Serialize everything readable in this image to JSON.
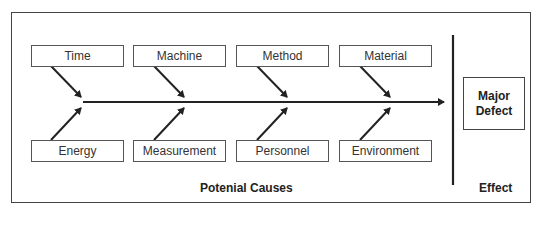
{
  "diagram": {
    "type": "fishbone",
    "top_causes": [
      "Time",
      "Machine",
      "Method",
      "Material"
    ],
    "bottom_causes": [
      "Energy",
      "Measurement",
      "Personnel",
      "Environment"
    ],
    "effect": {
      "line1": "Major",
      "line2": "Defect"
    },
    "causes_label": "Potenial Causes",
    "effect_label": "Effect"
  }
}
